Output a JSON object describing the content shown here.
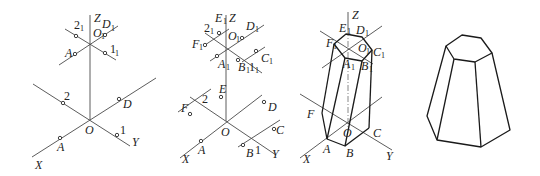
{
  "figure": {
    "panels": [
      {
        "id": "step-1",
        "labels": {
          "Z": "Z",
          "O1": "O",
          "O1_sub": "1",
          "D1": "D",
          "D1_sub": "1",
          "two1": "2",
          "two1_sub": "1",
          "A1": "A",
          "one1": "1",
          "one1_sub": "1",
          "two": "2",
          "D": "D",
          "O": "O",
          "A": "A",
          "one": "1",
          "X": "X",
          "Y": "Y"
        }
      },
      {
        "id": "step-2",
        "labels": {
          "Z": "Z",
          "E1": "E",
          "E1_sub": "1",
          "two1": "2",
          "two1_sub": "1",
          "O1": "O",
          "O1_sub": "1",
          "D1": "D",
          "D1_sub": "1",
          "F1": "F",
          "F1_sub": "1",
          "A1": "A",
          "A1_sub": "1",
          "B1": "B",
          "B1_sub": "1",
          "one1": "1",
          "one1_sub": "1",
          "C1": "C",
          "C1_sub": "1",
          "E": "E",
          "two": "2",
          "F": "F",
          "D": "D",
          "O": "O",
          "C": "C",
          "A": "A",
          "B": "B",
          "one": "1",
          "X": "X",
          "Y": "Y"
        }
      },
      {
        "id": "step-3",
        "labels": {
          "Z": "Z",
          "E1": "E",
          "E1_sub": "1",
          "D1": "D",
          "D1_sub": "1",
          "F1": "F",
          "F1_sub": "1",
          "O1": "O",
          "O1_sub": "1",
          "C1": "C",
          "C1_sub": "1",
          "A1": "A",
          "A1_sub": "1",
          "B1": "B",
          "B1_sub": "1",
          "F": "F",
          "O": "O",
          "C": "C",
          "A": "A",
          "B": "B",
          "X": "X",
          "Y": "Y"
        }
      },
      {
        "id": "step-4",
        "labels": {}
      }
    ]
  }
}
